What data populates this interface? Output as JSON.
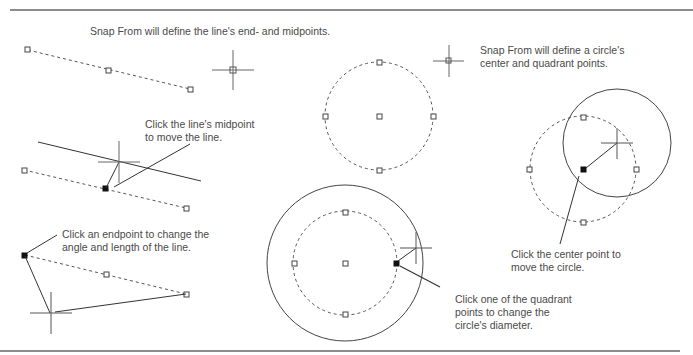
{
  "labels": {
    "snap_line": "Snap From will define the line's end- and midpoints.",
    "snap_circle_1": "Snap From will define a circle's",
    "snap_circle_2": "center and quadrant points.",
    "midpoint_1": "Click the line's midpoint",
    "midpoint_2": "to move the line.",
    "endpoint_1": "Click an endpoint to change the",
    "endpoint_2": "angle and length of the line.",
    "center_1": "Click the center point to",
    "center_2": "move the circle.",
    "quadrant_1": "Click one of the quadrant",
    "quadrant_2": "points to change the",
    "quadrant_3": "circle's diameter."
  },
  "colors": {
    "rule": "#666666",
    "line": "#333333",
    "dashed": "#555555",
    "text": "#4a4a4a"
  }
}
